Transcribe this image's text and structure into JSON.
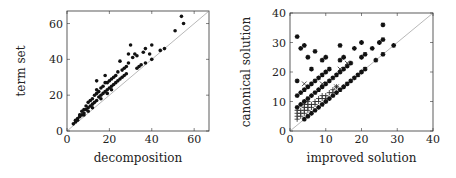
{
  "chart_data": [
    {
      "type": "scatter",
      "title": "",
      "xlabel": "decomposition",
      "ylabel": "term set",
      "xlim": [
        0,
        67
      ],
      "ylim": [
        0,
        67
      ],
      "xticks": [
        0,
        20,
        40,
        60
      ],
      "yticks": [
        0,
        20,
        40,
        60
      ],
      "grid": false,
      "diagonal": true,
      "marker": "dot",
      "series": [
        {
          "name": "instances",
          "points": [
            [
              54,
              64
            ],
            [
              55,
              60
            ],
            [
              51,
              56
            ],
            [
              46,
              46
            ],
            [
              44,
              45
            ],
            [
              40,
              48
            ],
            [
              40,
              40
            ],
            [
              39,
              43
            ],
            [
              37,
              46
            ],
            [
              36,
              44
            ],
            [
              37,
              38
            ],
            [
              35,
              37
            ],
            [
              34,
              36
            ],
            [
              33,
              35
            ],
            [
              33,
              42
            ],
            [
              32,
              43
            ],
            [
              31,
              41
            ],
            [
              30,
              48
            ],
            [
              29,
              43
            ],
            [
              29,
              38
            ],
            [
              28,
              36
            ],
            [
              28,
              32
            ],
            [
              27,
              35
            ],
            [
              26,
              34
            ],
            [
              25,
              39
            ],
            [
              25,
              29
            ],
            [
              24,
              33
            ],
            [
              24,
              28
            ],
            [
              23,
              31
            ],
            [
              23,
              27
            ],
            [
              22,
              30
            ],
            [
              22,
              26
            ],
            [
              21,
              29
            ],
            [
              21,
              25
            ],
            [
              20,
              28
            ],
            [
              20,
              24
            ],
            [
              19,
              27
            ],
            [
              19,
              23
            ],
            [
              18,
              31
            ],
            [
              18,
              27
            ],
            [
              18,
              22
            ],
            [
              17,
              25
            ],
            [
              17,
              21
            ],
            [
              16,
              24
            ],
            [
              16,
              20
            ],
            [
              15,
              22
            ],
            [
              15,
              19
            ],
            [
              14,
              28
            ],
            [
              14,
              23
            ],
            [
              14,
              21
            ],
            [
              14,
              17
            ],
            [
              13,
              20
            ],
            [
              13,
              16
            ],
            [
              12,
              18
            ],
            [
              12,
              15
            ],
            [
              11,
              17
            ],
            [
              11,
              14
            ],
            [
              10,
              16
            ],
            [
              10,
              13
            ],
            [
              9,
              14
            ],
            [
              9,
              12
            ],
            [
              8,
              12
            ],
            [
              8,
              10
            ],
            [
              7,
              11
            ],
            [
              7,
              9
            ],
            [
              6,
              9
            ],
            [
              6,
              8
            ],
            [
              5,
              7
            ],
            [
              5,
              6
            ],
            [
              4,
              5
            ],
            [
              4,
              6
            ],
            [
              3,
              4
            ],
            [
              27,
              31
            ],
            [
              26,
              30
            ],
            [
              21,
              23
            ],
            [
              19,
              21
            ],
            [
              16,
              18
            ],
            [
              12,
              13
            ],
            [
              10,
              11
            ],
            [
              8,
              9
            ]
          ]
        }
      ]
    },
    {
      "type": "scatter",
      "title": "",
      "xlabel": "improved solution",
      "ylabel": "canonical solution",
      "xlim": [
        0,
        40
      ],
      "ylim": [
        0,
        40
      ],
      "xticks": [
        0,
        10,
        20,
        30,
        40
      ],
      "yticks": [
        0,
        10,
        20,
        30,
        40
      ],
      "grid": false,
      "diagonal": true,
      "series": [
        {
          "name": "star",
          "marker": "star",
          "points": [
            [
              2,
              32
            ],
            [
              3,
              28
            ],
            [
              4,
              29
            ],
            [
              5,
              25
            ],
            [
              6,
              21
            ],
            [
              7,
              27
            ],
            [
              9,
              24
            ],
            [
              10,
              25
            ],
            [
              14,
              29
            ],
            [
              14,
              24
            ],
            [
              15,
              25
            ],
            [
              18,
              28
            ],
            [
              20,
              30
            ],
            [
              20,
              25
            ],
            [
              21,
              26
            ],
            [
              23,
              28
            ],
            [
              25,
              30
            ],
            [
              26,
              31
            ],
            [
              26,
              36
            ],
            [
              29,
              29
            ],
            [
              26,
              26
            ],
            [
              24,
              24
            ],
            [
              2,
              17
            ],
            [
              2,
              12
            ],
            [
              3,
              13
            ],
            [
              4,
              14
            ],
            [
              5,
              15
            ],
            [
              6,
              16
            ],
            [
              7,
              17
            ],
            [
              8,
              18
            ],
            [
              9,
              19
            ],
            [
              10,
              20
            ],
            [
              11,
              21
            ],
            [
              2,
              8
            ],
            [
              3,
              9
            ],
            [
              4,
              10
            ],
            [
              5,
              11
            ],
            [
              6,
              12
            ],
            [
              7,
              13
            ],
            [
              8,
              14
            ],
            [
              9,
              15
            ],
            [
              10,
              16
            ],
            [
              11,
              17
            ],
            [
              12,
              18
            ],
            [
              13,
              19
            ],
            [
              14,
              20
            ],
            [
              15,
              21
            ],
            [
              16,
              22
            ],
            [
              17,
              23
            ],
            [
              4,
              4
            ],
            [
              5,
              5
            ],
            [
              6,
              6
            ],
            [
              7,
              7
            ],
            [
              8,
              8
            ],
            [
              9,
              9
            ],
            [
              10,
              10
            ],
            [
              11,
              11
            ],
            [
              12,
              12
            ],
            [
              13,
              13
            ],
            [
              14,
              14
            ],
            [
              15,
              15
            ],
            [
              16,
              16
            ],
            [
              17,
              17
            ],
            [
              18,
              18
            ],
            [
              19,
              19
            ],
            [
              20,
              20
            ],
            [
              21,
              21
            ]
          ]
        },
        {
          "name": "cross",
          "marker": "plus",
          "points": [
            [
              2,
              4
            ],
            [
              2,
              5
            ],
            [
              2,
              6
            ],
            [
              2,
              7
            ],
            [
              3,
              5
            ],
            [
              3,
              6
            ],
            [
              3,
              7
            ],
            [
              4,
              6
            ],
            [
              4,
              7
            ],
            [
              4,
              8
            ],
            [
              5,
              7
            ],
            [
              5,
              8
            ],
            [
              5,
              9
            ],
            [
              6,
              8
            ],
            [
              6,
              9
            ],
            [
              7,
              9
            ],
            [
              7,
              10
            ],
            [
              8,
              10
            ],
            [
              8,
              11
            ],
            [
              9,
              11
            ],
            [
              9,
              12
            ],
            [
              10,
              11
            ],
            [
              10,
              12
            ],
            [
              11,
              13
            ],
            [
              12,
              13
            ],
            [
              12,
              14
            ],
            [
              13,
              15
            ],
            [
              4,
              9
            ],
            [
              5,
              10
            ]
          ]
        },
        {
          "name": "x",
          "marker": "x",
          "points": [
            [
              4,
              16
            ],
            [
              9,
              16
            ],
            [
              14,
              21
            ],
            [
              16,
              23
            ],
            [
              13,
              15
            ]
          ]
        }
      ]
    }
  ]
}
